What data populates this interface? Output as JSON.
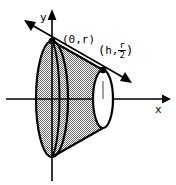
{
  "figure": {
    "background_color": "#ffffff",
    "stroke_color": "#000000",
    "fill_pattern": "50% gray dither checkerboard",
    "fill_color": "#8a8a8a"
  },
  "axes": {
    "x_label": "x",
    "y_label": "y",
    "origin_px": {
      "x": 52,
      "y": 99
    },
    "x_axis": {
      "from_px": {
        "x": 6,
        "y": 99
      },
      "to_px": {
        "x": 168,
        "y": 99
      },
      "arrow": "right"
    },
    "y_axis": {
      "from_px": {
        "x": 52,
        "y": 180
      },
      "to_px": {
        "x": 52,
        "y": 12
      },
      "arrow": "up"
    }
  },
  "points": [
    {
      "id": "p0",
      "label_text": "(0,r)",
      "label_open_paren": "(",
      "label_x_value": "0",
      "label_comma": ",",
      "label_y_value": "r",
      "label_close_paren": ")",
      "marker": "filled-dot",
      "position_px": {
        "x": 52,
        "y": 41
      }
    },
    {
      "id": "ph",
      "label_open_paren": "(",
      "label_x_value": "h",
      "label_comma": ",",
      "label_numerator": "r",
      "label_denominator": "2",
      "label_close_paren": ")",
      "marker": "filled-dot",
      "position_px": {
        "x": 103,
        "y": 70
      }
    }
  ],
  "slant_line": {
    "description": "Line through (0,r) and (h, r/2) extended with arrowheads at both ends",
    "arrow_start": "left-up",
    "arrow_end": "right-down",
    "from_px": {
      "x": 28,
      "y": 23
    },
    "to_px": {
      "x": 128,
      "y": 81
    }
  },
  "solid": {
    "shape": "frustum",
    "left_face": {
      "type": "ellipse",
      "center_px": {
        "x": 52,
        "y": 99
      },
      "radius_x_px": 16,
      "radius_y_px": 58,
      "shaded": true
    },
    "right_face": {
      "type": "ellipse",
      "center_px": {
        "x": 103,
        "y": 99
      },
      "radius_x_px": 10,
      "radius_y_px": 29,
      "shaded": false,
      "fill": "#ffffff"
    }
  }
}
